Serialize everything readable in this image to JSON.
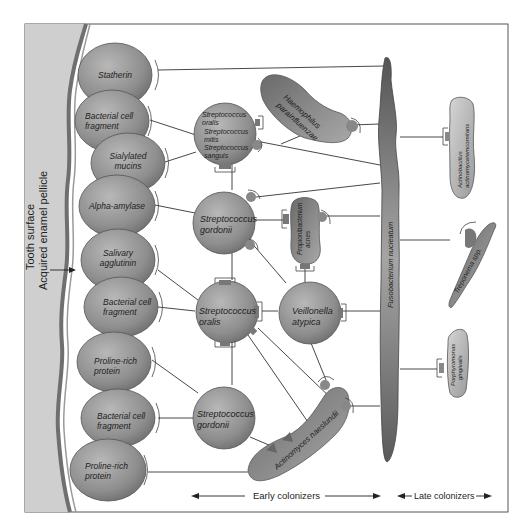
{
  "figure": {
    "tooth_label": "Tooth surface",
    "pellicle_label": "Acquired enamel pellicle",
    "early_label": "Early colonizers",
    "late_label": "Late colonizers",
    "colors": {
      "tooth": "#cfcfcf",
      "pellicle_band": "#7a7a7a",
      "node_fill": "#8f8f8f",
      "node_light": "#bdbdbd",
      "frame": "#555555"
    }
  },
  "pellicle_receptors": [
    {
      "label_1": "Statherin",
      "label_2": ""
    },
    {
      "label_1": "Bacterial cell",
      "label_2": "fragment"
    },
    {
      "label_1": "Sialylated",
      "label_2": "mucins"
    },
    {
      "label_1": "Alpha-amylase",
      "label_2": ""
    },
    {
      "label_1": "Salivary",
      "label_2": "agglutinin"
    },
    {
      "label_1": "Bacterial cell",
      "label_2": "fragment"
    },
    {
      "label_1": "Proline-rich",
      "label_2": "protein"
    },
    {
      "label_1": "Bacterial cell",
      "label_2": "fragment"
    },
    {
      "label_1": "Proline-rich",
      "label_2": "protein"
    }
  ],
  "early_colonizers": {
    "strep_group": {
      "line_1": "Streptococcus",
      "line_2": "oralis",
      "line_3": "Streptococcus",
      "line_4": "mitis",
      "line_5": "Streptococcus",
      "line_6": "sanguis"
    },
    "gordonii_top": {
      "line_1": "Streptococcus",
      "line_2": "gordonii"
    },
    "oralis": {
      "line_1": "Streptococcus",
      "line_2": "oralis"
    },
    "gordonii_bottom": {
      "line_1": "Streptococcus",
      "line_2": "gordonii"
    },
    "veillonella": {
      "line_1": "Veillonella",
      "line_2": "atypica"
    },
    "haemophilus": {
      "line_1": "Haemophilus",
      "line_2": "parainfluenzae"
    },
    "propionibacterium": {
      "line_1": "Propionibacterium",
      "line_2": "acnes"
    },
    "actinomyces": {
      "line_1": "Actinomyces naeslundii"
    }
  },
  "bridge": {
    "label": "Fusobacterium nucleatum"
  },
  "late_colonizers": {
    "actinobacillus": {
      "line_1": "Actinobacillus",
      "line_2": "actinomycetemcomitans"
    },
    "treponema": {
      "line_1": "Treponema spp."
    },
    "porphyromonas": {
      "line_1": "Porphyromonas",
      "line_2": "gingivalis"
    }
  }
}
